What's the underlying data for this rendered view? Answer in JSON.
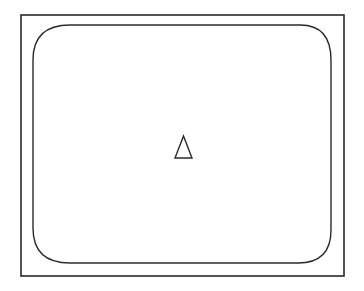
{
  "figure": {
    "stroke_color": "#2a2a2a",
    "background": "#ffffff",
    "outer_frame": {
      "x": 21,
      "y": 15,
      "width": 323,
      "height": 261
    },
    "screen": {
      "x": 33,
      "y": 25,
      "width": 298,
      "height": 238,
      "corner_radius": 28
    },
    "symbol": {
      "shape": "triangle",
      "apex": [
        183,
        136
      ],
      "base_left": [
        175,
        158
      ],
      "base_right": [
        192,
        158
      ]
    }
  }
}
